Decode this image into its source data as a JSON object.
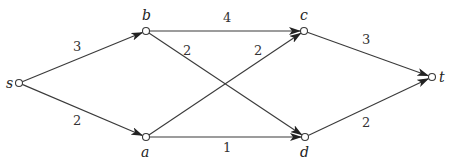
{
  "diagram": {
    "type": "directed-weighted-graph",
    "nodes": [
      {
        "id": "s",
        "label": "s",
        "x": 19,
        "y": 83,
        "lx": 6,
        "ly": 88
      },
      {
        "id": "b",
        "label": "b",
        "x": 146,
        "y": 31,
        "lx": 142,
        "ly": 20
      },
      {
        "id": "a",
        "label": "a",
        "x": 146,
        "y": 137,
        "lx": 141,
        "ly": 157
      },
      {
        "id": "c",
        "label": "c",
        "x": 304,
        "y": 31,
        "lx": 300,
        "ly": 20
      },
      {
        "id": "d",
        "label": "d",
        "x": 305,
        "y": 137,
        "lx": 300,
        "ly": 157
      },
      {
        "id": "t",
        "label": "t",
        "x": 432,
        "y": 77,
        "lx": 439,
        "ly": 82
      }
    ],
    "edges": [
      {
        "from": "s",
        "to": "b",
        "weight": "3",
        "wx": 73,
        "wy": 51
      },
      {
        "from": "s",
        "to": "a",
        "weight": "2",
        "wx": 73,
        "wy": 125
      },
      {
        "from": "b",
        "to": "c",
        "weight": "4",
        "wx": 223,
        "wy": 22
      },
      {
        "from": "b",
        "to": "d",
        "weight": "2",
        "wx": 183,
        "wy": 55
      },
      {
        "from": "a",
        "to": "c",
        "weight": "2",
        "wx": 254,
        "wy": 55
      },
      {
        "from": "a",
        "to": "d",
        "weight": "1",
        "wx": 223,
        "wy": 152
      },
      {
        "from": "c",
        "to": "t",
        "weight": "3",
        "wx": 362,
        "wy": 44
      },
      {
        "from": "d",
        "to": "t",
        "weight": "2",
        "wx": 362,
        "wy": 127
      }
    ]
  }
}
